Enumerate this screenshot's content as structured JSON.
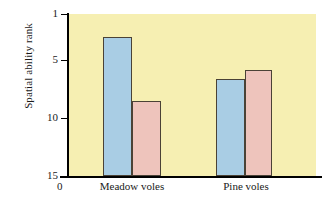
{
  "chart_data": {
    "type": "bar",
    "title": "",
    "subtitle": "",
    "xlabel": "",
    "ylabel": "Spatial ability rank",
    "categories": [
      "Meadow voles",
      "Pine voles"
    ],
    "series": [
      {
        "name": "blue-bar",
        "color": "#a9cde4",
        "values": [
          3.0,
          6.6
        ]
      },
      {
        "name": "pink-bar",
        "color": "#eec4bc",
        "values": [
          8.5,
          5.8
        ]
      }
    ],
    "yticks": [
      "1",
      "5",
      "10",
      "15"
    ],
    "ytick_values": [
      1,
      5,
      10,
      15
    ],
    "ylim": [
      15,
      1
    ],
    "y_axis_inverted": true,
    "origin_label": "0",
    "grid": false,
    "legend": "none",
    "plot_background": "#f6efb2",
    "bar_outline_color": "#4a4236"
  },
  "figure": {
    "caption_remnant": ""
  }
}
